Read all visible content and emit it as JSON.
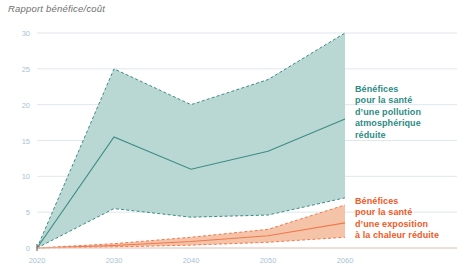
{
  "title": "Rapport bénéfice/coût",
  "legend": {
    "air": "Bénéfices\npour la santé\nd’une pollution\natmosphérique\nréduite",
    "heat": "Bénéfices\npour la santé\nd’une exposition\nà la chaleur réduite"
  },
  "colors": {
    "teal_fill": "#b9d8d4",
    "teal_line": "#3d8b86",
    "teal_text": "#2e8b85",
    "orange_fill": "#f5c4a8",
    "orange_line": "#ef7a4e",
    "orange_text": "#ef5a28",
    "grid": "#dfe7ef",
    "tick_text": "#aac4d6",
    "title_text": "#6f6f6f",
    "background": "#ffffff"
  },
  "chart_data": {
    "type": "area",
    "title": "Rapport bénéfice/coût",
    "xlabel": "",
    "ylabel": "Rapport bénéfice/coût",
    "x": [
      2020,
      2030,
      2040,
      2050,
      2060
    ],
    "xticklabels": [
      "2020",
      "2030",
      "2040",
      "2050",
      "2060"
    ],
    "yticks": [
      0,
      5,
      10,
      15,
      20,
      25,
      30
    ],
    "yticklabels": [
      "0",
      "5",
      "10",
      "15",
      "20",
      "25",
      "30"
    ],
    "ylim": [
      0,
      30
    ],
    "xlim": [
      2020,
      2060
    ],
    "grid": true,
    "legend_position": "right",
    "series": [
      {
        "name": "Bénéfices pour la santé d’une pollution atmosphérique réduite",
        "color": "#3d8b86",
        "fill": "#b9d8d4",
        "upper": [
          0,
          25.0,
          20.0,
          23.5,
          30.0
        ],
        "median": [
          0,
          15.5,
          11.0,
          13.5,
          18.0
        ],
        "lower": [
          0,
          5.5,
          4.3,
          4.6,
          7.0
        ]
      },
      {
        "name": "Bénéfices pour la santé d’une exposition à la chaleur réduite",
        "color": "#ef7a4e",
        "fill": "#f5c4a8",
        "upper": [
          0,
          0.6,
          1.5,
          2.6,
          6.0
        ],
        "median": [
          0,
          0.35,
          0.9,
          1.7,
          3.5
        ],
        "lower": [
          0,
          0.15,
          0.4,
          0.8,
          1.5
        ]
      }
    ]
  }
}
